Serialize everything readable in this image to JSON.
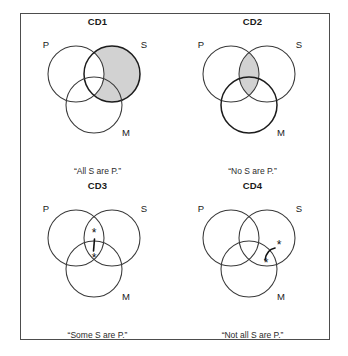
{
  "figure": {
    "title": "",
    "border_color": "#4d4d4d",
    "shade_color": "#d2d2d2",
    "line_color": "#3a3a3a"
  },
  "set_labels": {
    "p": "P",
    "s": "S",
    "m": "M"
  },
  "panels": [
    {
      "id": "cd1",
      "title": "CD1",
      "caption": "“All S are P.”",
      "labels": {
        "p": "P",
        "s": "S",
        "m": "M"
      },
      "marks": {
        "shaded_region": "S outside P",
        "asterisks": 0,
        "connector": "none"
      }
    },
    {
      "id": "cd2",
      "title": "CD2",
      "caption": "“No S are P.”",
      "labels": {
        "p": "P",
        "s": "S",
        "m": "M"
      },
      "marks": {
        "shaded_region": "P intersect S",
        "asterisks": 0,
        "connector": "none"
      }
    },
    {
      "id": "cd3",
      "title": "CD3",
      "caption": "“Some S are P.”",
      "labels": {
        "p": "P",
        "s": "S",
        "m": "M"
      },
      "marks": {
        "shaded_region": "none",
        "asterisks": 2,
        "connector": "straight-line",
        "asterisk_glyph": "*"
      }
    },
    {
      "id": "cd4",
      "title": "CD4",
      "caption": "“Not all S are P.”",
      "labels": {
        "p": "P",
        "s": "S",
        "m": "M"
      },
      "marks": {
        "shaded_region": "none",
        "asterisks": 2,
        "connector": "curved-arc",
        "asterisk_glyph": "*"
      }
    }
  ]
}
